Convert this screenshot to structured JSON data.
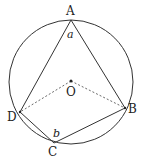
{
  "diagram": {
    "type": "inscribed-quadrilateral",
    "circle": {
      "cx": 71,
      "cy": 82,
      "r": 62
    },
    "center": {
      "label": "O",
      "x": 71,
      "y": 81
    },
    "points": {
      "A": {
        "label": "A",
        "x": 71,
        "y": 20
      },
      "B": {
        "label": "B",
        "x": 125,
        "y": 108
      },
      "C": {
        "label": "C",
        "x": 54,
        "y": 143
      },
      "D": {
        "label": "D",
        "x": 20,
        "y": 112
      }
    },
    "angles": {
      "a": {
        "label": "a",
        "vertex": "A"
      },
      "b": {
        "label": "b",
        "vertex": "C"
      }
    },
    "solid_segments": [
      "AB",
      "AD",
      "BC",
      "CD"
    ],
    "dashed_segments": [
      "OD",
      "OB"
    ]
  }
}
